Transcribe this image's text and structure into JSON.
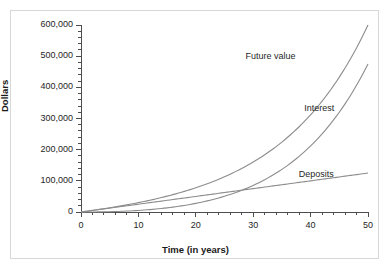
{
  "chart_data": {
    "type": "line",
    "title": "",
    "xlabel": "Time (in years)",
    "ylabel": "Dollars",
    "xlim": [
      0,
      50
    ],
    "ylim": [
      0,
      600000
    ],
    "grid": false,
    "legend_position": "inline-annotations",
    "x_ticks": [
      0,
      10,
      20,
      30,
      40,
      50
    ],
    "x_tick_labels": [
      "0",
      "10",
      "20",
      "30",
      "40",
      "50"
    ],
    "x_minor_tick_step": 2,
    "y_ticks": [
      0,
      100000,
      200000,
      300000,
      400000,
      500000,
      600000
    ],
    "y_tick_labels": [
      "0",
      "100,000",
      "200,000",
      "300,000",
      "400,000",
      "500,000",
      "600,000"
    ],
    "y_minor_tick_step": 20000,
    "x": [
      0,
      5,
      10,
      15,
      20,
      25,
      30,
      35,
      40,
      45,
      50
    ],
    "series": [
      {
        "name": "Future value",
        "color": "#8c8c8c",
        "values": [
          0,
          14500,
          35500,
          65500,
          108000,
          168000,
          252000,
          372000,
          540000,
          775000,
          600000
        ]
      },
      {
        "name": "Interest",
        "color": "#8c8c8c",
        "values": [
          0,
          2000,
          10500,
          28000,
          58000,
          105500,
          177000,
          284500,
          440000,
          662500,
          500000
        ]
      },
      {
        "name": "Deposits",
        "color": "#8c8c8c",
        "values": [
          0,
          12500,
          25000,
          37500,
          50000,
          62500,
          75000,
          87500,
          100000,
          112500,
          125000
        ]
      }
    ],
    "annotations": [
      {
        "text": "Future value",
        "x": 33,
        "y": 497000
      },
      {
        "text": "Interest",
        "x": 41.5,
        "y": 330000
      },
      {
        "text": "Deposits",
        "x": 41,
        "y": 120000
      }
    ],
    "colors": {
      "curve": "#8c8c8c",
      "axis": "#4d4d4d",
      "text": "#262626",
      "card_background": "#ffffff",
      "card_border": "#d8d8d8",
      "page_background": "#ffffff"
    }
  }
}
